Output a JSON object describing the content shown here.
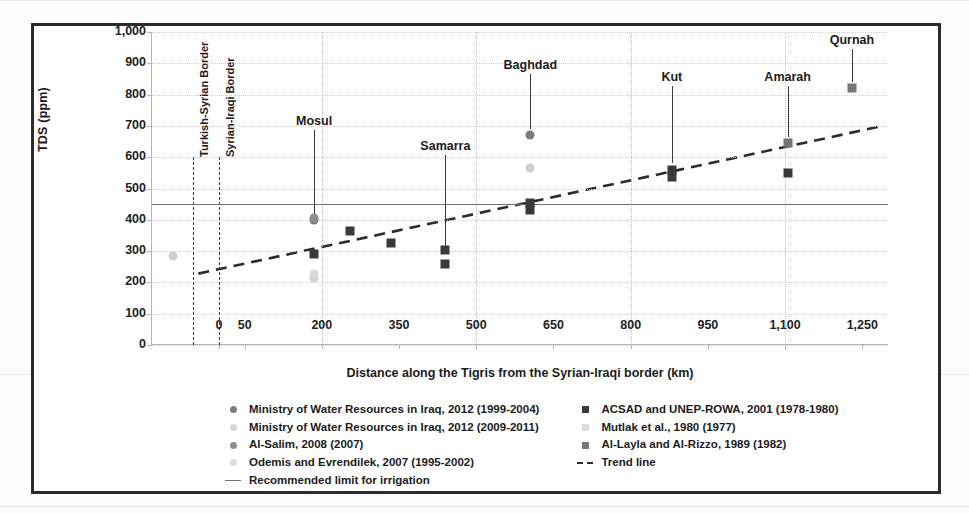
{
  "chart_data": {
    "type": "scatter",
    "title": "",
    "xlabel": "Distance along the Tigris from the Syrian-Iraqi border (km)",
    "ylabel": "TDS (ppm)",
    "xlim": [
      -130,
      1300
    ],
    "ylim": [
      0,
      1000
    ],
    "grid": true,
    "xticks": [
      "0",
      "50",
      "200",
      "350",
      "500",
      "650",
      "800",
      "950",
      "1,100",
      "1,250"
    ],
    "xtick_values": [
      0,
      50,
      200,
      350,
      500,
      650,
      800,
      950,
      1100,
      1250
    ],
    "yticks": [
      "0",
      "100",
      "200",
      "300",
      "400",
      "500",
      "600",
      "700",
      "800",
      "900",
      "1,000"
    ],
    "ytick_values": [
      0,
      100,
      200,
      300,
      400,
      500,
      600,
      700,
      800,
      900,
      1000
    ],
    "legend_position": "bottom",
    "series": [
      {
        "name": "Ministry of Water Resources in Iraq, 2012 (1999-2004)",
        "marker": "dot",
        "color": "#7c7c7c",
        "points": [
          {
            "x": 185,
            "y": 400
          },
          {
            "x": 605,
            "y": 670
          }
        ]
      },
      {
        "name": "Ministry of Water Resources in Iraq, 2012 (2009-2011)",
        "marker": "dot",
        "color": "#cfcfcf",
        "points": [
          {
            "x": -90,
            "y": 285
          },
          {
            "x": 185,
            "y": 215
          },
          {
            "x": 605,
            "y": 565
          }
        ]
      },
      {
        "name": "Al-Salim, 2008 (2007)",
        "marker": "dot",
        "color": "#8e8e8e",
        "points": [
          {
            "x": 185,
            "y": 405
          }
        ]
      },
      {
        "name": "Odemis and Evrendilek, 2007 (1995-2002)",
        "marker": "dot",
        "color": "#d8d8d8",
        "points": [
          {
            "x": 185,
            "y": 228
          }
        ]
      },
      {
        "name": "ACSAD and UNEP-ROWA, 2001 (1978-1980)",
        "marker": "square",
        "color": "#3a3a3a",
        "points": [
          {
            "x": 185,
            "y": 290
          },
          {
            "x": 255,
            "y": 365
          },
          {
            "x": 335,
            "y": 325
          },
          {
            "x": 440,
            "y": 305
          },
          {
            "x": 440,
            "y": 258
          },
          {
            "x": 605,
            "y": 455
          },
          {
            "x": 605,
            "y": 430
          },
          {
            "x": 880,
            "y": 560
          },
          {
            "x": 880,
            "y": 538
          },
          {
            "x": 1105,
            "y": 550
          }
        ]
      },
      {
        "name": "Mutlak et al., 1980 (1977)",
        "marker": "square",
        "color": "#dcdcdc",
        "points": []
      },
      {
        "name": "Al-Layla and Al-Rizzo, 1989 (1982)",
        "marker": "square",
        "color": "#767676",
        "points": [
          {
            "x": 1105,
            "y": 645
          },
          {
            "x": 1230,
            "y": 820
          }
        ]
      },
      {
        "name": "Recommended limit for irrigation",
        "marker": "solid-line",
        "color": "#6f6f6f",
        "value": 450,
        "x_start": -130,
        "x_end": 1300
      },
      {
        "name": "Trend line",
        "marker": "dashed-line",
        "color": "#2b2b2b",
        "x_start": -40,
        "y_start": 228,
        "x_end": 1290,
        "y_end": 700
      }
    ],
    "annotations": [
      {
        "label": "Turkish-Syrian Border",
        "x": -50,
        "type": "vertical-border"
      },
      {
        "label": "Syrian-Iraqi Border",
        "x": 0,
        "type": "vertical-border"
      },
      {
        "label": "Mosul",
        "x": 185,
        "label_y": 700,
        "leader_to_y": 420,
        "type": "city"
      },
      {
        "label": "Samarra",
        "x": 440,
        "label_y": 620,
        "leader_to_y": 312,
        "type": "city"
      },
      {
        "label": "Baghdad",
        "x": 605,
        "label_y": 880,
        "leader_to_y": 690,
        "type": "city"
      },
      {
        "label": "Kut",
        "x": 880,
        "label_y": 840,
        "leader_to_y": 580,
        "type": "city"
      },
      {
        "label": "Amarah",
        "x": 1105,
        "label_y": 840,
        "leader_to_y": 665,
        "type": "city"
      },
      {
        "label": "Qurnah",
        "x": 1230,
        "label_y": 960,
        "leader_to_y": 840,
        "type": "city"
      }
    ]
  },
  "legend": {
    "left_column": [
      {
        "label": "Ministry of Water Resources in Iraq, 2012 (1999-2004)",
        "swatch": "dot",
        "color": "#7c7c7c"
      },
      {
        "label": "Ministry of Water Resources in Iraq, 2012 (2009-2011)",
        "swatch": "dot",
        "color": "#d6d6d6"
      },
      {
        "label": "Al-Salim, 2008 (2007)",
        "swatch": "dot",
        "color": "#8e8e8e"
      },
      {
        "label": "Odemis and Evrendilek, 2007 (1995-2002)",
        "swatch": "dot",
        "color": "#dcdcdc"
      },
      {
        "label": "Recommended limit for irrigation",
        "swatch": "solid-line",
        "color": "#6f6f6f"
      }
    ],
    "right_column": [
      {
        "label": "ACSAD and UNEP-ROWA, 2001 (1978-1980)",
        "swatch": "square",
        "color": "#3a3a3a"
      },
      {
        "label": "Mutlak et al., 1980 (1977)",
        "swatch": "square",
        "color": "#dcdcdc"
      },
      {
        "label": "Al-Layla and Al-Rizzo, 1989 (1982)",
        "swatch": "square",
        "color": "#767676"
      },
      {
        "label": "Trend line",
        "swatch": "dashed-line",
        "color": "#2b2b2b"
      }
    ]
  }
}
